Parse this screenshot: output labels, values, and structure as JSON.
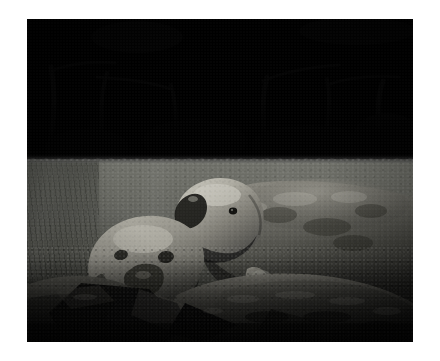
{
  "page": {
    "background_color": "#ffffff",
    "width": 440,
    "height": 361
  },
  "photo": {
    "alt": "Black and white underwater photograph of two manatees in a river",
    "caption": "",
    "frame": {
      "x": 27,
      "y": 19,
      "width": 386,
      "height": 323
    },
    "tone": "grayscale",
    "palette": {
      "page_background": "#ffffff",
      "canopy_dark": "#0a0a0a",
      "canopy_highlight": "#e6e6e6",
      "waterline": "#1c1c1c",
      "water_upper": "#6f7069",
      "water_lower": "#191a16",
      "manatee_light": "#a9a79e",
      "manatee_mid": "#74736c",
      "manatee_dark": "#3a3a35",
      "rock_light": "#8c8a82",
      "rock_dark": "#0d0d0c"
    },
    "regions": [
      {
        "name": "tree-canopy",
        "label": "Dense dark mangrove canopy with bright sunlit leaf highlights",
        "y_range": [
          0,
          142
        ]
      },
      {
        "name": "waterline",
        "label": "Dark horizontal surface line of the river",
        "y_range": [
          136,
          144
        ]
      },
      {
        "name": "water-column",
        "label": "Murky greenish-gray river water, lighter near surface and darkening toward the bottom",
        "y_range": [
          140,
          323
        ]
      },
      {
        "name": "rocky-bottom",
        "label": "Dark angular rocks and rubble along the riverbed in the foreground",
        "y_range": [
          218,
          323
        ]
      }
    ],
    "subjects": [
      {
        "name": "adult-manatee",
        "label": "Large adult manatee, body extending to the right edge, head turned toward the camera with snout raised",
        "position": {
          "x": 148,
          "y": 168,
          "width": 265,
          "height": 120
        }
      },
      {
        "name": "calf-manatee",
        "label": "Smaller manatee calf in front and to the left, facing the camera",
        "position": {
          "x": 70,
          "y": 198,
          "width": 120,
          "height": 92
        }
      },
      {
        "name": "manatee-flipper",
        "label": "Adult manatee front flipper reaching down toward the rocks",
        "position": {
          "x": 214,
          "y": 248,
          "width": 34,
          "height": 62
        }
      }
    ]
  }
}
